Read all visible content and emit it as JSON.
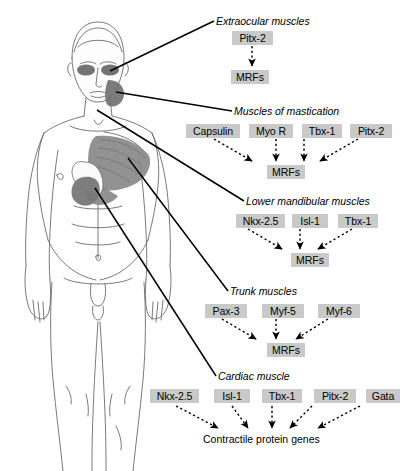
{
  "figure": {
    "name": "human-male-anatomy-front-view",
    "regions": [
      {
        "name": "extraocular-muscle-region",
        "shade": "#555555"
      },
      {
        "name": "masseter-muscle-region",
        "shade": "#6e6e6e"
      },
      {
        "name": "pectoralis-muscle-region",
        "shade": "#8c8c8c"
      },
      {
        "name": "heart-region",
        "shade": "#777777"
      }
    ]
  },
  "sections": [
    {
      "id": "extraocular",
      "heading": "Extraocular muscles",
      "genes": [
        "Pitx-2"
      ],
      "target": "MRFs"
    },
    {
      "id": "mastication",
      "heading": "Muscles of mastication",
      "genes": [
        "Capsulin",
        "Myo R",
        "Tbx-1",
        "Pitx-2"
      ],
      "target": "MRFs"
    },
    {
      "id": "mandibular",
      "heading": "Lower mandibular muscles",
      "genes": [
        "Nkx-2.5",
        "Isl-1",
        "Tbx-1"
      ],
      "target": "MRFs"
    },
    {
      "id": "trunk",
      "heading": "Trunk muscles",
      "genes": [
        "Pax-3",
        "Myf-5",
        "Myf-6"
      ],
      "target": "MRFs"
    },
    {
      "id": "cardiac",
      "heading": "Cardiac muscle",
      "genes": [
        "Nkx-2.5",
        "Isl-1",
        "Tbx-1",
        "Pitx-2",
        "Gata"
      ],
      "target": "Contractile protein genes"
    }
  ],
  "colors": {
    "node_background": "#c9c9c9",
    "text": "#000000",
    "leader_line": "#000000"
  }
}
